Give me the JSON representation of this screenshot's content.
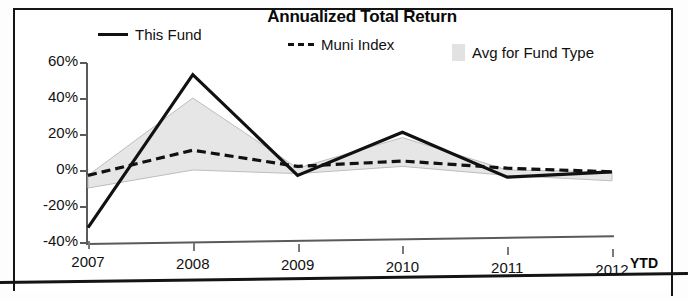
{
  "chart_data": {
    "type": "line",
    "title": "Annualized Total Return",
    "xlabel": "",
    "ylabel": "",
    "categories": [
      "2007",
      "2008",
      "2009",
      "2010",
      "2011",
      "2012"
    ],
    "x_tick_labels": [
      "2007",
      "2008",
      "2009",
      "2010",
      "2011",
      "2012"
    ],
    "x_axis_suffix": "YTD",
    "y_tick_labels": [
      "60%",
      "40%",
      "20%",
      "0%",
      "-20%",
      "-40%"
    ],
    "y_tick_values": [
      60,
      40,
      20,
      0,
      -20,
      -40
    ],
    "ylim": [
      -40,
      60
    ],
    "grid": false,
    "legend_position": "top",
    "series": [
      {
        "name": "This Fund",
        "style": "solid",
        "color": "#111111",
        "values": [
          -32,
          53,
          -3,
          21,
          -4,
          -1
        ]
      },
      {
        "name": "Muni Index",
        "style": "dashed",
        "color": "#111111",
        "values": [
          -3,
          11,
          2,
          5,
          1,
          -1
        ]
      },
      {
        "name": "Avg for Fund Type",
        "style": "band",
        "color": "#e2e2e2",
        "upper_values": [
          -3,
          40,
          1,
          18,
          0,
          -1
        ],
        "lower_values": [
          -10,
          0,
          -2,
          2,
          -3,
          -6
        ]
      }
    ]
  },
  "chart": {
    "title": "Annualized Total Return",
    "legend": [
      {
        "label": "This Fund",
        "marker": "solid-line-swatch"
      },
      {
        "label": "Muni Index",
        "marker": "dashed-line-swatch"
      },
      {
        "label": "Avg for Fund Type",
        "marker": "band-swatch"
      }
    ],
    "y_labels": [
      "60%",
      "40%",
      "20%",
      "0%",
      "-20%",
      "-40%"
    ],
    "x_labels": [
      "2007",
      "2008",
      "2009",
      "2010",
      "2011",
      "2012"
    ],
    "ytd": "YTD"
  }
}
